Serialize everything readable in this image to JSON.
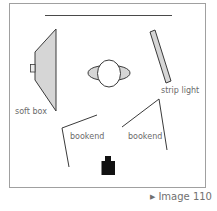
{
  "diagram": {
    "labels": {
      "soft_box": "soft box",
      "strip_light": "strip light",
      "bookend_left": "bookend",
      "bookend_right": "bookend"
    },
    "elements": [
      {
        "id": "background",
        "type": "backdrop"
      },
      {
        "id": "soft_box",
        "type": "light",
        "label": "soft box"
      },
      {
        "id": "strip_light",
        "type": "light",
        "label": "strip light"
      },
      {
        "id": "subject",
        "type": "person"
      },
      {
        "id": "bookend_left",
        "type": "reflector",
        "label": "bookend"
      },
      {
        "id": "bookend_right",
        "type": "reflector",
        "label": "bookend"
      },
      {
        "id": "camera",
        "type": "camera"
      }
    ],
    "colors": {
      "frame": "#a0a0a0",
      "line": "#3a3a3a",
      "fill": "#d6d6d6",
      "camera": "#111111",
      "text": "#6a6a6a"
    }
  },
  "caption": {
    "arrow_icon": "▶",
    "text": "Image 110"
  }
}
